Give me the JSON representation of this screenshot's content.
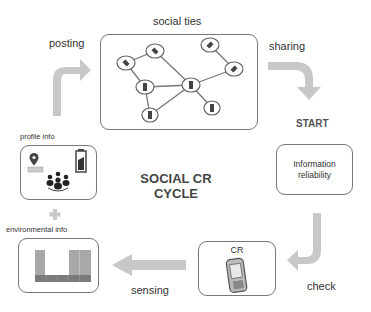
{
  "diagram": {
    "title_line1": "SOCIAL CR",
    "title_line2": "CYCLE",
    "labels": {
      "social_ties": "social ties",
      "posting": "posting",
      "sharing": "sharing",
      "start": "START",
      "information_reliability_line1": "Information",
      "information_reliability_line2": "reliability",
      "check": "check",
      "cr": "CR",
      "sensing": "sensing",
      "profile_info": "profile info",
      "environmental_info": "environmental info",
      "plus": "+"
    },
    "icons": {
      "profile": [
        "location-pin-icon",
        "battery-icon",
        "group-people-icon"
      ],
      "cr": "mobile-phone-icon",
      "environmental": "bar-chart-icon",
      "social": "network-graph-icon"
    },
    "colors": {
      "arrow": "#c8c8c8",
      "box_border": "#777777",
      "text": "#333333",
      "bar_light": "#a8a8a8",
      "bar_dark": "#7a7a7a"
    },
    "cycle_order": [
      "START",
      "Information reliability",
      "check",
      "CR",
      "sensing",
      "environmental info",
      "profile info",
      "posting",
      "social ties",
      "sharing"
    ]
  }
}
